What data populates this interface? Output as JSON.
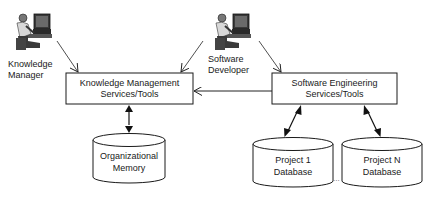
{
  "actors": [
    {
      "id": "knowledge-manager",
      "lines": [
        "Knowledge",
        "Manager"
      ],
      "icon": "person-at-computer-icon"
    },
    {
      "id": "software-developer",
      "lines": [
        "Software",
        "Developer"
      ],
      "icon": "person-at-computer-icon"
    }
  ],
  "boxes": [
    {
      "id": "km-services",
      "lines": [
        "Knowledge Management",
        "Services/Tools"
      ]
    },
    {
      "id": "se-services",
      "lines": [
        "Software Engineering",
        "Services/Tools"
      ]
    }
  ],
  "databases": [
    {
      "id": "organizational-memory",
      "lines": [
        "Organizational",
        "Memory"
      ]
    },
    {
      "id": "project-1-database",
      "lines": [
        "Project 1",
        "Database"
      ]
    },
    {
      "id": "project-n-database",
      "lines": [
        "Project N",
        "Database"
      ]
    }
  ],
  "ellipsis": "...",
  "colors": {
    "stroke": "#1a1a1a",
    "background": "#ffffff"
  }
}
